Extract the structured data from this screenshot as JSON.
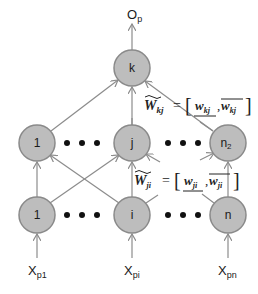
{
  "diagram": {
    "output_label": {
      "main": "O",
      "sub": "p"
    },
    "output_node": {
      "label": "k"
    },
    "hidden_layer": [
      {
        "label": "1"
      },
      {
        "label": "j"
      },
      {
        "label": "n",
        "sub": "2"
      }
    ],
    "input_layer": [
      {
        "label": "1"
      },
      {
        "label": "i"
      },
      {
        "label": "n"
      }
    ],
    "input_labels": [
      {
        "main": "X",
        "sub": "p1"
      },
      {
        "main": "X",
        "sub": "pi"
      },
      {
        "main": "X",
        "sub": "pn"
      }
    ],
    "ellipsis": "• • •",
    "weights_hidden_output": {
      "lhs": "W",
      "lhs_sub": "kj",
      "equals": "=",
      "lower": "w",
      "lower_sub": "kj",
      "upper": "w",
      "upper_sub": "kj"
    },
    "weights_input_hidden": {
      "lhs": "W",
      "lhs_sub": "ji",
      "equals": "=",
      "lower": "w",
      "lower_sub": "ji",
      "upper": "w",
      "upper_sub": "ji"
    },
    "colors": {
      "node_fill": "#bdbdbd",
      "node_stroke": "#8a8a8a",
      "edge": "#8c8c8c",
      "text": "#1a1a1a"
    }
  }
}
